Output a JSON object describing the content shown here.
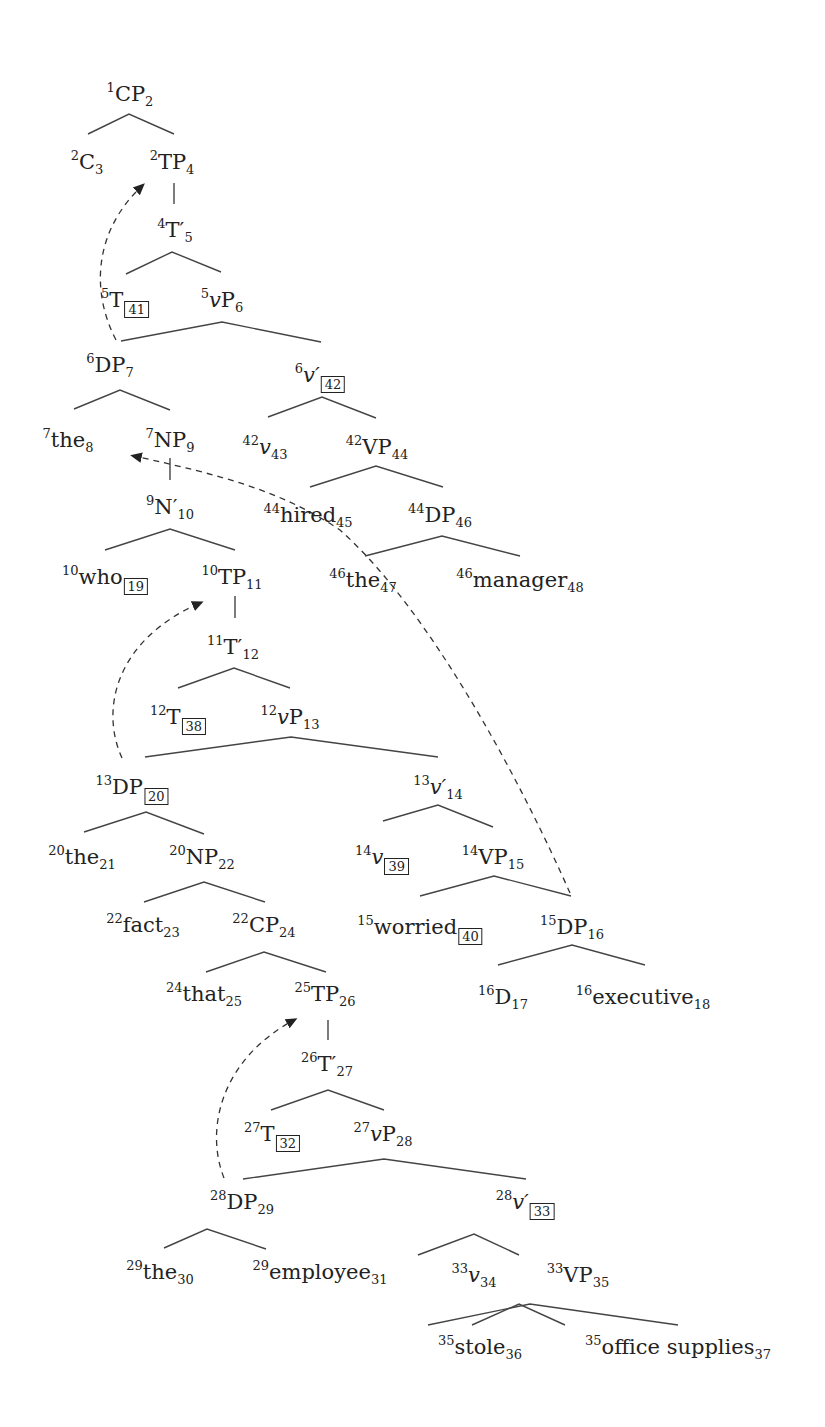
{
  "diagram": {
    "type": "syntax-tree",
    "nodes": [
      {
        "id": "cp",
        "pre": "1",
        "cat": "CP",
        "post": "2",
        "x": 130,
        "y": 82
      },
      {
        "id": "c",
        "pre": "2",
        "cat": "C",
        "post": "3",
        "x": 87,
        "y": 150
      },
      {
        "id": "tp1",
        "pre": "2",
        "cat": "TP",
        "post": "4",
        "x": 172,
        "y": 150
      },
      {
        "id": "tbar1",
        "pre": "4",
        "cat": "T′",
        "post": "5",
        "x": 175,
        "y": 218
      },
      {
        "id": "t1",
        "pre": "5",
        "cat": "T",
        "box": "41",
        "x": 125,
        "y": 288
      },
      {
        "id": "vp1",
        "pre": "5",
        "cat": "vP",
        "post": "6",
        "x": 222,
        "y": 288,
        "italic_v": true
      },
      {
        "id": "dp1",
        "pre": "6",
        "cat": "DP",
        "post": "7",
        "x": 110,
        "y": 353
      },
      {
        "id": "vbar1",
        "pre": "6",
        "cat": "v′",
        "box": "42",
        "x": 320,
        "y": 363,
        "italic": true
      },
      {
        "id": "the1",
        "pre": "7",
        "cat": "the",
        "post": "8",
        "x": 68,
        "y": 428
      },
      {
        "id": "np1",
        "pre": "7",
        "cat": "NP",
        "post": "9",
        "x": 170,
        "y": 428
      },
      {
        "id": "v1",
        "pre": "42",
        "cat": "v",
        "post": "43",
        "x": 265,
        "y": 435,
        "italic": true
      },
      {
        "id": "vp_h",
        "pre": "42",
        "cat": "VP",
        "post": "44",
        "x": 377,
        "y": 435
      },
      {
        "id": "nbar",
        "pre": "9",
        "cat": "N′",
        "post": "10",
        "x": 170,
        "y": 495
      },
      {
        "id": "hired",
        "pre": "44",
        "cat": "hired",
        "post": "45",
        "x": 308,
        "y": 503
      },
      {
        "id": "dp_h",
        "pre": "44",
        "cat": "DP",
        "post": "46",
        "x": 440,
        "y": 503
      },
      {
        "id": "who",
        "pre": "10",
        "cat": "who",
        "box": "19",
        "x": 105,
        "y": 565
      },
      {
        "id": "tp2",
        "pre": "10",
        "cat": "TP",
        "post": "11",
        "x": 232,
        "y": 565
      },
      {
        "id": "the_m",
        "pre": "46",
        "cat": "the",
        "post": "47",
        "x": 363,
        "y": 568
      },
      {
        "id": "manager",
        "pre": "46",
        "cat": "manager",
        "post": "48",
        "x": 520,
        "y": 568
      },
      {
        "id": "tbar2",
        "pre": "11",
        "cat": "T′",
        "post": "12",
        "x": 233,
        "y": 635
      },
      {
        "id": "t2",
        "pre": "12",
        "cat": "T",
        "box": "38",
        "x": 178,
        "y": 705
      },
      {
        "id": "vp2",
        "pre": "12",
        "cat": "vP",
        "post": "13",
        "x": 290,
        "y": 705,
        "italic_v": true
      },
      {
        "id": "dp2",
        "pre": "13",
        "cat": "DP",
        "box": "20",
        "x": 132,
        "y": 775
      },
      {
        "id": "vbar2",
        "pre": "13",
        "cat": "v′",
        "post": "14",
        "x": 438,
        "y": 775,
        "italic": true
      },
      {
        "id": "the2",
        "pre": "20",
        "cat": "the",
        "post": "21",
        "x": 82,
        "y": 845
      },
      {
        "id": "np2",
        "pre": "20",
        "cat": "NP",
        "post": "22",
        "x": 202,
        "y": 845
      },
      {
        "id": "v2",
        "pre": "14",
        "cat": "v",
        "box": "39",
        "x": 382,
        "y": 845,
        "italic": true
      },
      {
        "id": "vp_w",
        "pre": "14",
        "cat": "VP",
        "post": "15",
        "x": 493,
        "y": 845
      },
      {
        "id": "fact",
        "pre": "22",
        "cat": "fact",
        "post": "23",
        "x": 143,
        "y": 913
      },
      {
        "id": "cp2",
        "pre": "22",
        "cat": "CP",
        "post": "24",
        "x": 264,
        "y": 913
      },
      {
        "id": "worried",
        "pre": "15",
        "cat": "worried",
        "box": "40",
        "x": 420,
        "y": 915
      },
      {
        "id": "dp_e",
        "pre": "15",
        "cat": "DP",
        "post": "16",
        "x": 572,
        "y": 915
      },
      {
        "id": "that",
        "pre": "24",
        "cat": "that",
        "post": "25",
        "x": 204,
        "y": 982
      },
      {
        "id": "tp3",
        "pre": "25",
        "cat": "TP",
        "post": "26",
        "x": 325,
        "y": 982
      },
      {
        "id": "d_e",
        "pre": "16",
        "cat": "D",
        "post": "17",
        "x": 503,
        "y": 985
      },
      {
        "id": "executive",
        "pre": "16",
        "cat": "executive",
        "post": "18",
        "x": 643,
        "y": 985
      },
      {
        "id": "tbar3",
        "pre": "26",
        "cat": "T′",
        "post": "27",
        "x": 327,
        "y": 1052
      },
      {
        "id": "t3",
        "pre": "27",
        "cat": "T",
        "box": "32",
        "x": 272,
        "y": 1122
      },
      {
        "id": "vp3",
        "pre": "27",
        "cat": "vP",
        "post": "28",
        "x": 383,
        "y": 1122,
        "italic_v": true
      },
      {
        "id": "dp3",
        "pre": "28",
        "cat": "DP",
        "post": "29",
        "x": 242,
        "y": 1190
      },
      {
        "id": "vbar3",
        "pre": "28",
        "cat": "v′",
        "box": "33",
        "x": 525,
        "y": 1190,
        "italic": true
      },
      {
        "id": "the3",
        "pre": "29",
        "cat": "the",
        "post": "30",
        "x": 160,
        "y": 1260
      },
      {
        "id": "employee",
        "pre": "29",
        "cat": "employee",
        "post": "31",
        "x": 320,
        "y": 1260
      },
      {
        "id": "v3",
        "pre": "33",
        "cat": "v",
        "post": "34",
        "x": 474,
        "y": 1263,
        "italic": true
      },
      {
        "id": "vp_s",
        "pre": "33",
        "cat": "VP",
        "post": "35",
        "x": 578,
        "y": 1263
      },
      {
        "id": "stole",
        "pre": "35",
        "cat": "stole",
        "post": "36",
        "x": 480,
        "y": 1335
      },
      {
        "id": "supplies",
        "pre": "35",
        "cat": "office supplies",
        "post": "37",
        "x": 678,
        "y": 1335
      }
    ],
    "movements": [
      {
        "from": "DP_7",
        "to": "TP_4"
      },
      {
        "from": "DP_16",
        "to": "NP_9"
      },
      {
        "from": "DP_20",
        "to": "TP_11"
      },
      {
        "from": "DP_29",
        "to": "TP_26"
      }
    ]
  }
}
